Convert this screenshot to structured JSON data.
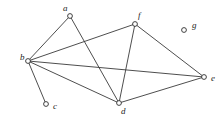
{
  "figure": {
    "name": "undirected-graph",
    "background_color": "#ffffff",
    "line_color": "#3a3a3a",
    "node_fill_color": "#ffffff",
    "node_stroke_color": "#2e2e2e",
    "label_color": "#1d1d1d",
    "width": 222,
    "height": 121
  },
  "vertices": [
    {
      "id": "a",
      "label": "a",
      "cx": 70,
      "cy": 16,
      "r": 2.4,
      "lx": 63,
      "ly": 9,
      "degree": 2
    },
    {
      "id": "b",
      "label": "b",
      "cx": 28,
      "cy": 61,
      "r": 2.4,
      "lx": 20,
      "ly": 58,
      "degree": 5
    },
    {
      "id": "c",
      "label": "c",
      "cx": 46,
      "cy": 104,
      "r": 2.4,
      "lx": 53,
      "ly": 107,
      "degree": 1
    },
    {
      "id": "d",
      "label": "d",
      "cx": 119,
      "cy": 103,
      "r": 2.4,
      "lx": 121,
      "ly": 112,
      "degree": 4
    },
    {
      "id": "e",
      "label": "e",
      "cx": 204,
      "cy": 77,
      "r": 2.4,
      "lx": 211,
      "ly": 79,
      "degree": 3
    },
    {
      "id": "f",
      "label": "f",
      "cx": 135,
      "cy": 24,
      "r": 2.4,
      "lx": 138,
      "ly": 16,
      "degree": 3
    },
    {
      "id": "g",
      "label": "g",
      "cx": 184,
      "cy": 30,
      "r": 2.4,
      "lx": 192,
      "ly": 26,
      "degree": 0
    }
  ],
  "edges": [
    {
      "id": "a-b",
      "from": "a",
      "to": "b",
      "x1": 70,
      "y1": 16,
      "x2": 28,
      "y2": 61
    },
    {
      "id": "a-d",
      "from": "a",
      "to": "d",
      "x1": 70,
      "y1": 16,
      "x2": 119,
      "y2": 103
    },
    {
      "id": "b-c",
      "from": "b",
      "to": "c",
      "x1": 28,
      "y1": 61,
      "x2": 46,
      "y2": 104
    },
    {
      "id": "b-d",
      "from": "b",
      "to": "d",
      "x1": 28,
      "y1": 61,
      "x2": 119,
      "y2": 103
    },
    {
      "id": "b-e",
      "from": "b",
      "to": "e",
      "x1": 28,
      "y1": 61,
      "x2": 204,
      "y2": 77
    },
    {
      "id": "b-f",
      "from": "b",
      "to": "f",
      "x1": 28,
      "y1": 61,
      "x2": 135,
      "y2": 24
    },
    {
      "id": "d-e",
      "from": "d",
      "to": "e",
      "x1": 119,
      "y1": 103,
      "x2": 204,
      "y2": 77
    },
    {
      "id": "d-f",
      "from": "d",
      "to": "f",
      "x1": 119,
      "y1": 103,
      "x2": 135,
      "y2": 24
    },
    {
      "id": "e-f",
      "from": "f",
      "to": "e",
      "x1": 135,
      "y1": 24,
      "x2": 204,
      "y2": 77
    }
  ]
}
